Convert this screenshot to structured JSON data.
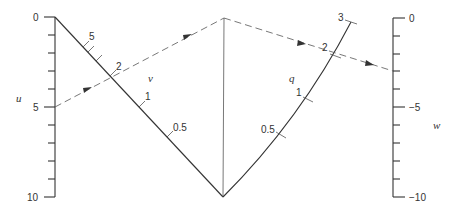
{
  "diagram": {
    "type": "nomogram",
    "u_scale": {
      "variable": "u",
      "labels": [
        "0",
        "5",
        "10"
      ],
      "minor_ticks": 10
    },
    "v_scale": {
      "variable": "v",
      "labels": [
        "5",
        "2",
        "1",
        "0.5"
      ]
    },
    "q_scale": {
      "variable": "q",
      "labels": [
        "3",
        "2",
        "1",
        "0.5"
      ]
    },
    "w_scale": {
      "variable": "w",
      "labels": [
        "0",
        "−5",
        "−10"
      ],
      "minor_ticks": 10
    },
    "example_path": {
      "description": "Dashed isopleth from u=5 through v=2 to the apex, then through q=2 to w",
      "u": "5",
      "v": "2",
      "q": "2"
    }
  }
}
